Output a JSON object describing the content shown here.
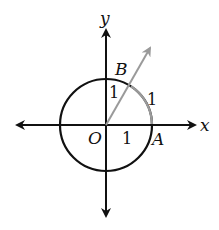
{
  "diagram": {
    "type": "unit-circle",
    "axes": {
      "x_label": "x",
      "y_label": "y"
    },
    "points": {
      "origin": "O",
      "a": "A",
      "b": "B"
    },
    "segment_labels": {
      "radius_horizontal": "1",
      "radius_vertical": "1",
      "arc_length": "1"
    },
    "colors": {
      "axes": "#111111",
      "circle": "#111111",
      "ray": "#9a9a9a",
      "highlighted_arc": "#9a9a9a"
    },
    "geometry": {
      "center": [
        106,
        125
      ],
      "radius": 46,
      "ray_angle_deg": 57.3
    }
  }
}
